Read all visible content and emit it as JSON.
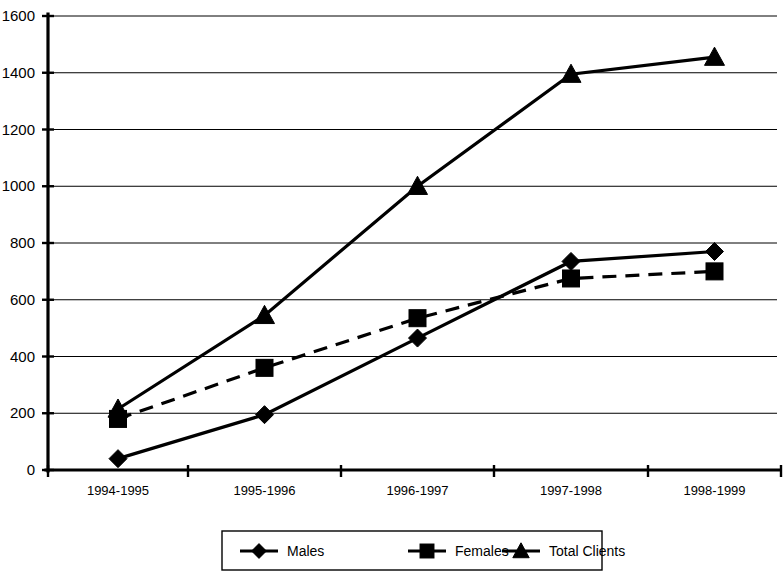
{
  "chart_data": {
    "type": "line",
    "title": "",
    "xlabel": "",
    "ylabel": "",
    "categories": [
      "1994-1995",
      "1995-1996",
      "1996-1997",
      "1997-1998",
      "1998-1999"
    ],
    "ylim": [
      0,
      1600
    ],
    "ytick_labels": [
      "1600",
      "1400",
      "1200",
      "1000",
      "800",
      "600",
      "400",
      "200",
      "0"
    ],
    "ytick_values": [
      1600,
      1400,
      1200,
      1000,
      800,
      600,
      400,
      200,
      0
    ],
    "grid": true,
    "legend_position": "bottom",
    "series": [
      {
        "name": "Males",
        "marker": "diamond",
        "line_style": "solid",
        "color": "#000000",
        "values": [
          40,
          195,
          465,
          735,
          770
        ]
      },
      {
        "name": "Females",
        "marker": "square",
        "line_style": "dashed",
        "color": "#000000",
        "values": [
          180,
          360,
          535,
          675,
          700
        ]
      },
      {
        "name": "Total Clients",
        "marker": "triangle",
        "line_style": "solid",
        "color": "#000000",
        "values": [
          215,
          545,
          1000,
          1395,
          1455
        ]
      }
    ]
  },
  "legend": {
    "items": [
      {
        "label": "Males",
        "marker": "diamond"
      },
      {
        "label": "Females",
        "marker": "square"
      },
      {
        "label": "Total Clients",
        "marker": "triangle"
      }
    ]
  }
}
